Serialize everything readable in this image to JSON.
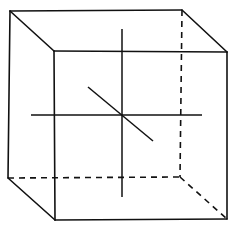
{
  "diagram": {
    "colors": {
      "stroke": "#111111",
      "background": "#ffffff"
    },
    "cube": {
      "visible_edges": 9,
      "hidden_edges": 3
    },
    "axes": [
      "vertical-axis",
      "horizontal-axis",
      "depth-axis"
    ]
  }
}
